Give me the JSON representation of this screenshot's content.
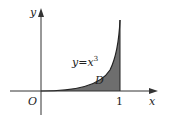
{
  "diagram": {
    "axis_x_label": "x",
    "axis_y_label": "y",
    "origin_label": "O",
    "tick_x_1": "1",
    "curve_label_base": "y=x",
    "curve_label_exp": "3",
    "region_label": "D",
    "colors": {
      "axis": "#333333",
      "curve": "#222222",
      "region_fill": "#6e6e6e",
      "background": "#ffffff"
    }
  }
}
